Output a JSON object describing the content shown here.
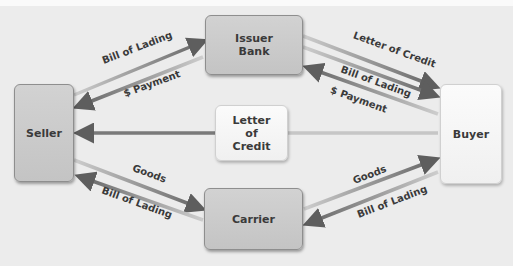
{
  "diagram": {
    "type": "letter-of-credit-flow",
    "nodes": {
      "seller": {
        "label": "Seller"
      },
      "buyer": {
        "label": "Buyer"
      },
      "issuer_bank": {
        "line1": "Issuer",
        "line2": "Bank"
      },
      "letter_of_credit": {
        "line1": "Letter",
        "line2": "of",
        "line3": "Credit"
      },
      "carrier": {
        "label": "Carrier"
      }
    },
    "edges": [
      {
        "id": "seller-bank-bol",
        "from": "Seller",
        "to": "Issuer Bank",
        "label": "Bill of Lading"
      },
      {
        "id": "bank-seller-pay",
        "from": "Issuer Bank",
        "to": "Seller",
        "label": "$ Payment"
      },
      {
        "id": "bank-buyer-loc",
        "from": "Issuer Bank",
        "to": "Buyer",
        "label": "Letter of Credit"
      },
      {
        "id": "bank-buyer-bol",
        "from": "Issuer Bank",
        "to": "Buyer",
        "label": "Bill of Lading"
      },
      {
        "id": "buyer-bank-pay",
        "from": "Buyer",
        "to": "Issuer Bank",
        "label": "$ Payment"
      },
      {
        "id": "buyer-seller-loc",
        "from": "Buyer",
        "to": "Seller",
        "label": ""
      },
      {
        "id": "seller-carrier-goods",
        "from": "Seller",
        "to": "Carrier",
        "label": "Goods"
      },
      {
        "id": "carrier-seller-bol",
        "from": "Carrier",
        "to": "Seller",
        "label": "Bill of Lading"
      },
      {
        "id": "carrier-buyer-goods",
        "from": "Carrier",
        "to": "Buyer",
        "label": "Goods"
      },
      {
        "id": "buyer-carrier-bol",
        "from": "Buyer",
        "to": "Carrier",
        "label": "Bill of Lading"
      }
    ]
  },
  "colors": {
    "background": "#ececec",
    "node_gray": "#c8c8c8",
    "node_white": "#f6f6f6",
    "arrow_dark": "#6e6e6e",
    "arrow_light": "#c4c4c4",
    "text": "#3a3a3a"
  }
}
